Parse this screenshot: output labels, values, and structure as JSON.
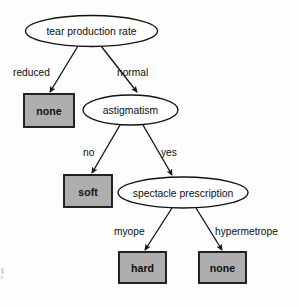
{
  "diagram": {
    "type": "decision-tree",
    "colors": {
      "leaf_fill": "#aeaeae",
      "node_fill": "#ffffff",
      "stroke": "#141214",
      "background": "#fdfdfd"
    },
    "decision_nodes": [
      {
        "id": "root",
        "label": "tear production rate",
        "cx": 91.5,
        "cy": 31,
        "rx": 66,
        "ry": 15.5
      },
      {
        "id": "astig",
        "label": "astigmatism",
        "cx": 130.5,
        "cy": 110,
        "rx": 47.5,
        "ry": 15
      },
      {
        "id": "spec",
        "label": "spectacle prescription",
        "cx": 183,
        "cy": 192.5,
        "rx": 65,
        "ry": 15.5
      }
    ],
    "leaf_nodes": [
      {
        "id": "leaf-none-1",
        "label": "none",
        "x": 24,
        "y": 94,
        "w": 50,
        "h": 33
      },
      {
        "id": "leaf-soft",
        "label": "soft",
        "x": 64,
        "y": 175,
        "w": 48,
        "h": 32
      },
      {
        "id": "leaf-hard",
        "label": "hard",
        "x": 119,
        "y": 252,
        "w": 47,
        "h": 31
      },
      {
        "id": "leaf-none-2",
        "label": "none",
        "x": 199,
        "y": 252,
        "w": 47,
        "h": 31
      }
    ],
    "edges": [
      {
        "id": "edge-reduced",
        "label": "reduced",
        "from": "root",
        "to": "leaf-none-1",
        "x1": 78,
        "y1": 46,
        "x2": 50,
        "y2": 92,
        "label_x": 13,
        "label_y": 72
      },
      {
        "id": "edge-normal",
        "label": "normal",
        "from": "root",
        "to": "astig",
        "x1": 101,
        "y1": 46,
        "x2": 137,
        "y2": 92,
        "label_x": 117,
        "label_y": 72
      },
      {
        "id": "edge-no",
        "label": "no",
        "from": "astig",
        "to": "leaf-soft",
        "x1": 120,
        "y1": 125,
        "x2": 92,
        "y2": 173,
        "label_x": 83,
        "label_y": 152
      },
      {
        "id": "edge-yes",
        "label": "yes",
        "from": "astig",
        "to": "spec",
        "x1": 143,
        "y1": 125,
        "x2": 172,
        "y2": 175,
        "label_x": 161,
        "label_y": 152
      },
      {
        "id": "edge-myope",
        "label": "myope",
        "from": "spec",
        "to": "leaf-hard",
        "x1": 172,
        "y1": 208,
        "x2": 145,
        "y2": 250,
        "label_x": 114,
        "label_y": 231
      },
      {
        "id": "edge-hypermetrope",
        "label": "hypermetrope",
        "from": "spec",
        "to": "leaf-none-2",
        "x1": 196,
        "y1": 208,
        "x2": 222,
        "y2": 250,
        "label_x": 215,
        "label_y": 231
      }
    ]
  }
}
